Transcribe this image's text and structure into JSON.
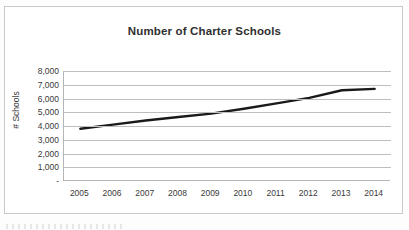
{
  "chart_data": {
    "type": "line",
    "title": "Number of Charter Schools",
    "xlabel": "",
    "ylabel": "# Schools",
    "categories": [
      "2005",
      "2006",
      "2007",
      "2008",
      "2009",
      "2010",
      "2011",
      "2012",
      "2013",
      "2014"
    ],
    "x": [
      2005,
      2006,
      2007,
      2008,
      2009,
      2010,
      2011,
      2012,
      2013,
      2014
    ],
    "values": [
      3800,
      4100,
      4400,
      4650,
      4900,
      5250,
      5650,
      6050,
      6600,
      6700
    ],
    "series": [
      {
        "name": "# Schools",
        "values": [
          3800,
          4100,
          4400,
          4650,
          4900,
          5250,
          5650,
          6050,
          6600,
          6700
        ],
        "color": "#1a1a1a"
      }
    ],
    "ylim": [
      0,
      8000
    ],
    "ytick_values": [
      0,
      1000,
      2000,
      3000,
      4000,
      5000,
      6000,
      7000,
      8000
    ],
    "ytick_labels": [
      "-",
      "1,000",
      "2,000",
      "3,000",
      "4,000",
      "5,000",
      "6,000",
      "7,000",
      "8,000"
    ],
    "grid": "horizontal",
    "legend": "none",
    "line_color": "#1a1a1a",
    "gridline_color": "#bdbdbd",
    "axis_color": "#b5b5b5",
    "title_color": "#303030",
    "frame_color": "#c9c9c9"
  }
}
